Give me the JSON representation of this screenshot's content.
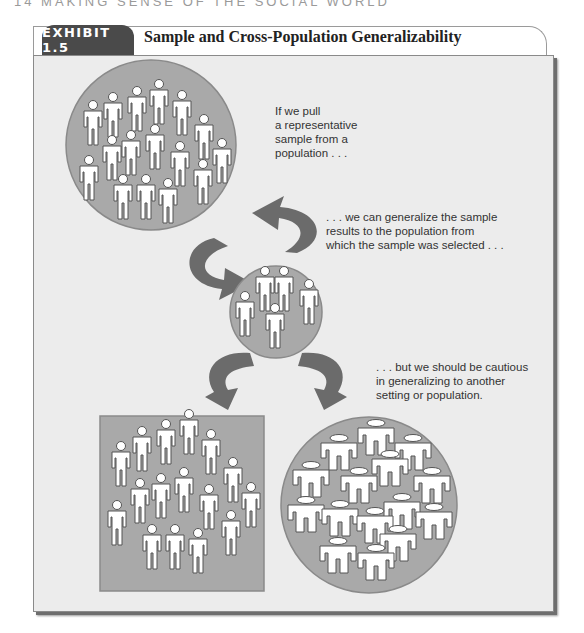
{
  "running_head": "14   MAKING SENSE OF THE SOCIAL WORLD",
  "exhibit": {
    "label": "EXHIBIT 1.5",
    "title": "Sample and Cross-Population Generalizability"
  },
  "captions": {
    "population": [
      "If we pull",
      "a representative",
      "sample from a",
      "population . . ."
    ],
    "generalize": [
      ". . . we can generalize the sample",
      "results to the population from",
      "which the sample was selected . . ."
    ],
    "caution": [
      ". . . but we should be cautious",
      "in generalizing to another",
      "setting or population."
    ]
  },
  "diagram": {
    "nodes": [
      {
        "id": "population",
        "shape": "circle",
        "figures": 17
      },
      {
        "id": "sample",
        "shape": "circle",
        "figures": 5
      },
      {
        "id": "other-setting",
        "shape": "square",
        "figures": 17
      },
      {
        "id": "other-population",
        "shape": "circle",
        "figures": 16,
        "figure_style": "wide"
      }
    ],
    "edges": [
      {
        "from": "population",
        "to": "sample",
        "label": "sampling"
      },
      {
        "from": "sample",
        "to": "population",
        "label": "generalize"
      },
      {
        "from": "sample",
        "to": "other-setting",
        "label": "cautious"
      },
      {
        "from": "sample",
        "to": "other-population",
        "label": "cautious"
      }
    ]
  },
  "colors": {
    "panel": "#ececec",
    "shape_fill": "#a9a9a9",
    "arrow": "#6b6b6b",
    "tab": "#4a4a4a"
  }
}
